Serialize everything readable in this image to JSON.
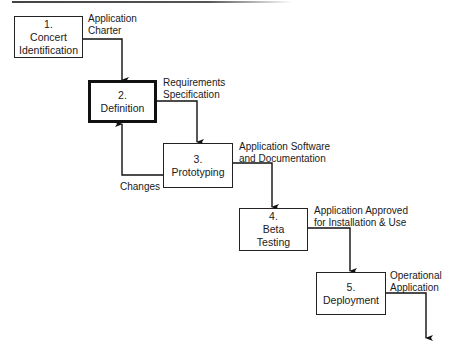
{
  "diagram": {
    "title": "",
    "steps": [
      {
        "number": "1.",
        "name": "Concert Identification",
        "lines": [
          "Concert",
          "Identification"
        ],
        "highlighted": false
      },
      {
        "number": "2.",
        "name": "Definition",
        "lines": [
          "Definition"
        ],
        "highlighted": true
      },
      {
        "number": "3.",
        "name": "Prototyping",
        "lines": [
          "Prototyping"
        ],
        "highlighted": false
      },
      {
        "number": "4.",
        "name": "Beta Testing",
        "lines": [
          "Beta",
          "Testing"
        ],
        "highlighted": false
      },
      {
        "number": "5.",
        "name": "Deployment",
        "lines": [
          "Deployment"
        ],
        "highlighted": false
      }
    ],
    "outputs": [
      {
        "from": "1",
        "to": "2",
        "lines": [
          "Application",
          "Charter"
        ]
      },
      {
        "from": "2",
        "to": "3",
        "lines": [
          "Requirements",
          "Specification"
        ]
      },
      {
        "from": "3",
        "to": "4",
        "lines": [
          "Application Software",
          "and Documentation"
        ]
      },
      {
        "from": "4",
        "to": "5",
        "lines": [
          "Application Approved",
          "for Installation & Use"
        ]
      },
      {
        "from": "5",
        "to": "",
        "lines": [
          "Operational",
          "Application"
        ]
      }
    ],
    "feedback": {
      "from": "3",
      "to": "2",
      "label": "Changes"
    }
  }
}
